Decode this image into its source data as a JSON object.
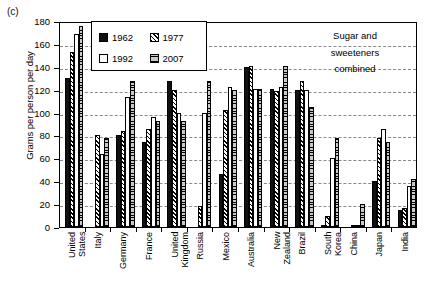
{
  "panel": {
    "label": "(c)"
  },
  "annotation": {
    "line1": "Sugar and",
    "line2": "sweeteners",
    "line3": "combined"
  },
  "legend": {
    "items": [
      {
        "label": "1962",
        "key": "s1962"
      },
      {
        "label": "1977",
        "key": "s1977"
      },
      {
        "label": "1992",
        "key": "s1992"
      },
      {
        "label": "2007",
        "key": "s2007"
      }
    ]
  },
  "chart_data": {
    "type": "bar",
    "title": "",
    "xlabel": "",
    "ylabel": "Grams per person per day",
    "ylim": [
      0,
      180
    ],
    "yticks": [
      0,
      20,
      40,
      60,
      80,
      100,
      120,
      140,
      160,
      180
    ],
    "grid": true,
    "legend_position": "top-left-inside",
    "annotation_text": "Sugar and sweeteners combined",
    "categories": [
      "United States",
      "Italy",
      "Germany",
      "France",
      "United Kingdom",
      "Russia",
      "Mexico",
      "Australia",
      "New Zealand",
      "Brazil",
      "South Korea",
      "China",
      "Japan",
      "India"
    ],
    "category_lines": [
      [
        "United",
        "States"
      ],
      [
        "Italy"
      ],
      [
        "Germany"
      ],
      [
        "France"
      ],
      [
        "United",
        "Kingdom"
      ],
      [
        "Russia"
      ],
      [
        "Mexico"
      ],
      [
        "Australia"
      ],
      [
        "New",
        "Zealand"
      ],
      [
        "Brazil"
      ],
      [
        "South",
        "Korea"
      ],
      [
        "China"
      ],
      [
        "Japan"
      ],
      [
        "India"
      ]
    ],
    "series": [
      {
        "name": "1962",
        "values": [
          130,
          0,
          80,
          74,
          128,
          0,
          46,
          140,
          121,
          120,
          2,
          0,
          40,
          15
        ]
      },
      {
        "name": "1977",
        "values": [
          153,
          80,
          84,
          86,
          120,
          18,
          102,
          141,
          119,
          128,
          10,
          1,
          78,
          17
        ]
      },
      {
        "name": "1992",
        "values": [
          169,
          64,
          114,
          96,
          100,
          100,
          122,
          121,
          122,
          120,
          60,
          2,
          86,
          36
        ]
      },
      {
        "name": "2007",
        "values": [
          176,
          78,
          128,
          93,
          93,
          128,
          120,
          121,
          141,
          105,
          78,
          20,
          74,
          42
        ]
      }
    ]
  }
}
